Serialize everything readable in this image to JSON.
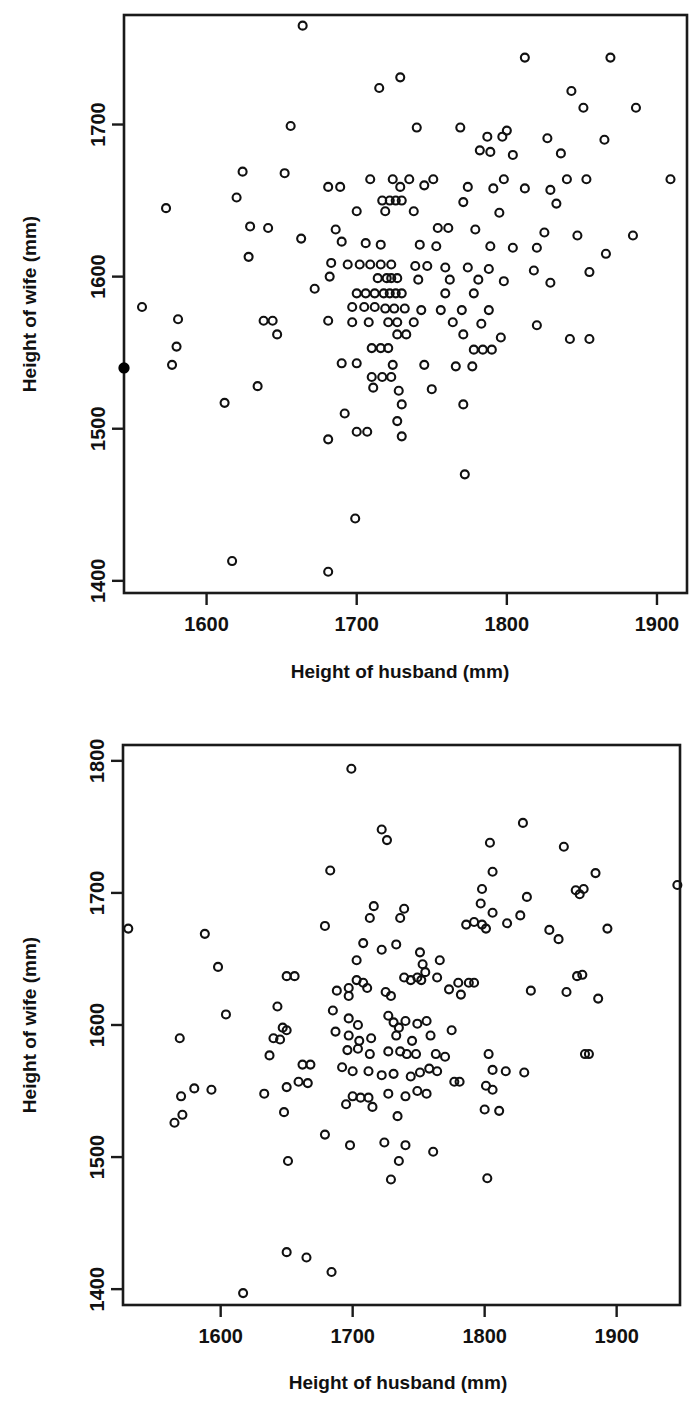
{
  "page": {
    "background_color": "#ffffff",
    "marker_color": "#111111",
    "axis_color": "#1a1a1a"
  },
  "chart_data": [
    {
      "id": "top",
      "type": "scatter",
      "title": "",
      "xlabel": "Height of husband (mm)",
      "ylabel": "Height of wife (mm)",
      "xticks": [
        1600,
        1700,
        1800,
        1900
      ],
      "yticks": [
        1400,
        1500,
        1600,
        1700
      ],
      "xtick_labels": [
        "1600",
        "1700",
        "1800",
        "1900"
      ],
      "ytick_labels": [
        "1400",
        "1500",
        "1600",
        "1700"
      ],
      "xlim": [
        1545,
        1920
      ],
      "ylim": [
        1392,
        1772
      ],
      "grid": false,
      "legend": null,
      "marker": "open-circle",
      "highlight_marker": "filled-circle",
      "highlight_points": [
        [
          1545,
          1540
        ]
      ],
      "points": [
        [
          1664,
          1765
        ],
        [
          1812,
          1744
        ],
        [
          1869,
          1744
        ],
        [
          1729,
          1731
        ],
        [
          1715,
          1724
        ],
        [
          1843,
          1722
        ],
        [
          1851,
          1711
        ],
        [
          1886,
          1711
        ],
        [
          1656,
          1699
        ],
        [
          1740,
          1698
        ],
        [
          1769,
          1698
        ],
        [
          1787,
          1692
        ],
        [
          1797,
          1692
        ],
        [
          1827,
          1691
        ],
        [
          1865,
          1690
        ],
        [
          1800,
          1696
        ],
        [
          1782,
          1683
        ],
        [
          1789,
          1682
        ],
        [
          1836,
          1681
        ],
        [
          1804,
          1680
        ],
        [
          1624,
          1669
        ],
        [
          1652,
          1668
        ],
        [
          1709,
          1664
        ],
        [
          1724,
          1664
        ],
        [
          1735,
          1664
        ],
        [
          1751,
          1664
        ],
        [
          1798,
          1664
        ],
        [
          1840,
          1664
        ],
        [
          1853,
          1664
        ],
        [
          1909,
          1664
        ],
        [
          1681,
          1659
        ],
        [
          1689,
          1659
        ],
        [
          1729,
          1659
        ],
        [
          1745,
          1660
        ],
        [
          1774,
          1659
        ],
        [
          1791,
          1658
        ],
        [
          1812,
          1658
        ],
        [
          1829,
          1657
        ],
        [
          1620,
          1652
        ],
        [
          1717,
          1650
        ],
        [
          1722,
          1650
        ],
        [
          1726,
          1650
        ],
        [
          1730,
          1650
        ],
        [
          1771,
          1649
        ],
        [
          1833,
          1648
        ],
        [
          1573,
          1645
        ],
        [
          1700,
          1643
        ],
        [
          1719,
          1643
        ],
        [
          1738,
          1643
        ],
        [
          1795,
          1642
        ],
        [
          1629,
          1633
        ],
        [
          1641,
          1632
        ],
        [
          1686,
          1631
        ],
        [
          1754,
          1632
        ],
        [
          1761,
          1632
        ],
        [
          1779,
          1631
        ],
        [
          1847,
          1627
        ],
        [
          1884,
          1627
        ],
        [
          1825,
          1629
        ],
        [
          1663,
          1625
        ],
        [
          1690,
          1623
        ],
        [
          1706,
          1622
        ],
        [
          1716,
          1621
        ],
        [
          1742,
          1621
        ],
        [
          1753,
          1620
        ],
        [
          1789,
          1620
        ],
        [
          1804,
          1619
        ],
        [
          1820,
          1619
        ],
        [
          1866,
          1615
        ],
        [
          1628,
          1613
        ],
        [
          1683,
          1609
        ],
        [
          1694,
          1608
        ],
        [
          1702,
          1608
        ],
        [
          1709,
          1608
        ],
        [
          1716,
          1608
        ],
        [
          1723,
          1608
        ],
        [
          1739,
          1607
        ],
        [
          1747,
          1607
        ],
        [
          1759,
          1606
        ],
        [
          1774,
          1606
        ],
        [
          1788,
          1605
        ],
        [
          1818,
          1604
        ],
        [
          1855,
          1603
        ],
        [
          1682,
          1600
        ],
        [
          1714,
          1599
        ],
        [
          1720,
          1599
        ],
        [
          1723,
          1599
        ],
        [
          1727,
          1599
        ],
        [
          1741,
          1598
        ],
        [
          1762,
          1598
        ],
        [
          1781,
          1598
        ],
        [
          1798,
          1597
        ],
        [
          1829,
          1596
        ],
        [
          1672,
          1592
        ],
        [
          1700,
          1589
        ],
        [
          1706,
          1589
        ],
        [
          1712,
          1589
        ],
        [
          1718,
          1589
        ],
        [
          1722,
          1589
        ],
        [
          1726,
          1589
        ],
        [
          1730,
          1589
        ],
        [
          1759,
          1589
        ],
        [
          1778,
          1589
        ],
        [
          1557,
          1580
        ],
        [
          1697,
          1580
        ],
        [
          1705,
          1580
        ],
        [
          1712,
          1580
        ],
        [
          1719,
          1579
        ],
        [
          1725,
          1579
        ],
        [
          1732,
          1579
        ],
        [
          1743,
          1578
        ],
        [
          1756,
          1578
        ],
        [
          1770,
          1578
        ],
        [
          1788,
          1578
        ],
        [
          1581,
          1572
        ],
        [
          1638,
          1571
        ],
        [
          1644,
          1571
        ],
        [
          1681,
          1571
        ],
        [
          1697,
          1570
        ],
        [
          1708,
          1570
        ],
        [
          1721,
          1570
        ],
        [
          1727,
          1570
        ],
        [
          1738,
          1570
        ],
        [
          1764,
          1570
        ],
        [
          1783,
          1569
        ],
        [
          1820,
          1568
        ],
        [
          1647,
          1562
        ],
        [
          1727,
          1562
        ],
        [
          1733,
          1562
        ],
        [
          1771,
          1562
        ],
        [
          1796,
          1560
        ],
        [
          1842,
          1559
        ],
        [
          1855,
          1559
        ],
        [
          1580,
          1554
        ],
        [
          1710,
          1553
        ],
        [
          1716,
          1553
        ],
        [
          1721,
          1553
        ],
        [
          1778,
          1552
        ],
        [
          1784,
          1552
        ],
        [
          1790,
          1552
        ],
        [
          1577,
          1542
        ],
        [
          1690,
          1543
        ],
        [
          1700,
          1543
        ],
        [
          1724,
          1542
        ],
        [
          1745,
          1542
        ],
        [
          1766,
          1541
        ],
        [
          1777,
          1541
        ],
        [
          1710,
          1534
        ],
        [
          1717,
          1534
        ],
        [
          1723,
          1534
        ],
        [
          1634,
          1528
        ],
        [
          1711,
          1527
        ],
        [
          1728,
          1525
        ],
        [
          1750,
          1526
        ],
        [
          1612,
          1517
        ],
        [
          1730,
          1516
        ],
        [
          1771,
          1516
        ],
        [
          1692,
          1510
        ],
        [
          1727,
          1505
        ],
        [
          1700,
          1498
        ],
        [
          1707,
          1498
        ],
        [
          1730,
          1495
        ],
        [
          1681,
          1493
        ],
        [
          1772,
          1470
        ],
        [
          1699,
          1441
        ],
        [
          1617,
          1413
        ],
        [
          1681,
          1406
        ]
      ]
    },
    {
      "id": "bottom",
      "type": "scatter",
      "title": "",
      "xlabel": "Height of husband (mm)",
      "ylabel": "Height of wife (mm)",
      "xticks": [
        1600,
        1700,
        1800,
        1900
      ],
      "yticks": [
        1400,
        1500,
        1600,
        1700,
        1800
      ],
      "xtick_labels": [
        "1600",
        "1700",
        "1800",
        "1900"
      ],
      "ytick_labels": [
        "1400",
        "1500",
        "1600",
        "1700",
        "1800"
      ],
      "xlim": [
        1526,
        1948
      ],
      "ylim": [
        1388,
        1812
      ],
      "grid": false,
      "legend": null,
      "marker": "open-circle",
      "points": [
        [
          1699,
          1794
        ],
        [
          1829,
          1753
        ],
        [
          1722,
          1748
        ],
        [
          1726,
          1740
        ],
        [
          1804,
          1738
        ],
        [
          1860,
          1735
        ],
        [
          1683,
          1717
        ],
        [
          1806,
          1716
        ],
        [
          1884,
          1715
        ],
        [
          1946,
          1706
        ],
        [
          1875,
          1703
        ],
        [
          1798,
          1703
        ],
        [
          1869,
          1702
        ],
        [
          1872,
          1699
        ],
        [
          1832,
          1697
        ],
        [
          1797,
          1692
        ],
        [
          1716,
          1690
        ],
        [
          1739,
          1688
        ],
        [
          1806,
          1685
        ],
        [
          1827,
          1683
        ],
        [
          1713,
          1681
        ],
        [
          1736,
          1681
        ],
        [
          1792,
          1678
        ],
        [
          1798,
          1676
        ],
        [
          1817,
          1677
        ],
        [
          1786,
          1676
        ],
        [
          1801,
          1673
        ],
        [
          1530,
          1673
        ],
        [
          1588,
          1669
        ],
        [
          1679,
          1675
        ],
        [
          1849,
          1672
        ],
        [
          1893,
          1673
        ],
        [
          1856,
          1665
        ],
        [
          1708,
          1662
        ],
        [
          1733,
          1661
        ],
        [
          1722,
          1657
        ],
        [
          1751,
          1655
        ],
        [
          1703,
          1649
        ],
        [
          1766,
          1649
        ],
        [
          1598,
          1644
        ],
        [
          1753,
          1646
        ],
        [
          1755,
          1640
        ],
        [
          1870,
          1637
        ],
        [
          1650,
          1637
        ],
        [
          1656,
          1637
        ],
        [
          1703,
          1634
        ],
        [
          1708,
          1632
        ],
        [
          1739,
          1636
        ],
        [
          1744,
          1634
        ],
        [
          1749,
          1636
        ],
        [
          1752,
          1634
        ],
        [
          1764,
          1636
        ],
        [
          1780,
          1632
        ],
        [
          1788,
          1632
        ],
        [
          1792,
          1632
        ],
        [
          1697,
          1628
        ],
        [
          1711,
          1628
        ],
        [
          1688,
          1626
        ],
        [
          1697,
          1622
        ],
        [
          1725,
          1625
        ],
        [
          1729,
          1622
        ],
        [
          1773,
          1627
        ],
        [
          1782,
          1623
        ],
        [
          1835,
          1626
        ],
        [
          1862,
          1625
        ],
        [
          1886,
          1620
        ],
        [
          1604,
          1608
        ],
        [
          1643,
          1614
        ],
        [
          1685,
          1611
        ],
        [
          1874,
          1638
        ],
        [
          1647,
          1598
        ],
        [
          1650,
          1596
        ],
        [
          1697,
          1605
        ],
        [
          1704,
          1600
        ],
        [
          1727,
          1607
        ],
        [
          1731,
          1602
        ],
        [
          1735,
          1598
        ],
        [
          1740,
          1603
        ],
        [
          1749,
          1601
        ],
        [
          1756,
          1603
        ],
        [
          1569,
          1590
        ],
        [
          1640,
          1590
        ],
        [
          1645,
          1589
        ],
        [
          1687,
          1595
        ],
        [
          1697,
          1592
        ],
        [
          1705,
          1588
        ],
        [
          1714,
          1590
        ],
        [
          1733,
          1592
        ],
        [
          1745,
          1588
        ],
        [
          1759,
          1592
        ],
        [
          1775,
          1596
        ],
        [
          1696,
          1581
        ],
        [
          1704,
          1582
        ],
        [
          1713,
          1578
        ],
        [
          1727,
          1580
        ],
        [
          1736,
          1580
        ],
        [
          1741,
          1578
        ],
        [
          1748,
          1578
        ],
        [
          1763,
          1578
        ],
        [
          1770,
          1576
        ],
        [
          1803,
          1578
        ],
        [
          1876,
          1578
        ],
        [
          1879,
          1578
        ],
        [
          1637,
          1577
        ],
        [
          1662,
          1570
        ],
        [
          1668,
          1570
        ],
        [
          1692,
          1568
        ],
        [
          1700,
          1565
        ],
        [
          1712,
          1565
        ],
        [
          1722,
          1562
        ],
        [
          1731,
          1563
        ],
        [
          1744,
          1561
        ],
        [
          1751,
          1564
        ],
        [
          1758,
          1567
        ],
        [
          1764,
          1565
        ],
        [
          1777,
          1557
        ],
        [
          1781,
          1557
        ],
        [
          1806,
          1566
        ],
        [
          1816,
          1565
        ],
        [
          1830,
          1564
        ],
        [
          1580,
          1552
        ],
        [
          1570,
          1546
        ],
        [
          1593,
          1551
        ],
        [
          1633,
          1548
        ],
        [
          1650,
          1553
        ],
        [
          1659,
          1557
        ],
        [
          1666,
          1556
        ],
        [
          1700,
          1546
        ],
        [
          1706,
          1545
        ],
        [
          1712,
          1545
        ],
        [
          1727,
          1548
        ],
        [
          1740,
          1546
        ],
        [
          1749,
          1550
        ],
        [
          1756,
          1548
        ],
        [
          1801,
          1554
        ],
        [
          1806,
          1551
        ],
        [
          1571,
          1532
        ],
        [
          1565,
          1526
        ],
        [
          1648,
          1534
        ],
        [
          1695,
          1540
        ],
        [
          1715,
          1538
        ],
        [
          1734,
          1531
        ],
        [
          1800,
          1536
        ],
        [
          1811,
          1535
        ],
        [
          1679,
          1517
        ],
        [
          1698,
          1509
        ],
        [
          1724,
          1511
        ],
        [
          1740,
          1509
        ],
        [
          1735,
          1497
        ],
        [
          1761,
          1504
        ],
        [
          1651,
          1497
        ],
        [
          1729,
          1483
        ],
        [
          1802,
          1484
        ],
        [
          1650,
          1428
        ],
        [
          1665,
          1424
        ],
        [
          1684,
          1413
        ],
        [
          1617,
          1397
        ]
      ]
    }
  ]
}
